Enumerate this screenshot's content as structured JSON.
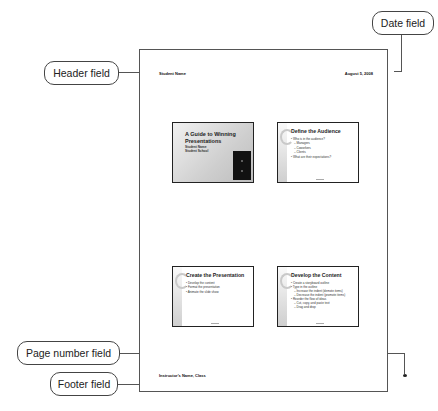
{
  "callouts": {
    "header": "Header field",
    "date": "Date field",
    "page_number": "Page number field",
    "footer": "Footer field"
  },
  "page": {
    "header_text": "Student Name",
    "date_text": "August 5, 2008",
    "footer_text": "Instructor's Name, Class"
  },
  "slides": [
    {
      "type": "title",
      "title": "A Guide to Winning Presentations",
      "subtitle_lines": [
        "Student Name",
        "Student School"
      ]
    },
    {
      "type": "content",
      "title": "Define the Audience",
      "bullets": [
        {
          "text": "• Who is in the audience?",
          "level": 1
        },
        {
          "text": "– Managers",
          "level": 2
        },
        {
          "text": "– Coworkers",
          "level": 2
        },
        {
          "text": "– Clients",
          "level": 2
        },
        {
          "text": "• What are their expectations?",
          "level": 1
        }
      ]
    },
    {
      "type": "content",
      "title": "Create the Presentation",
      "bullets": [
        {
          "text": "• Develop the content",
          "level": 1
        },
        {
          "text": "• Format the presentation",
          "level": 1
        },
        {
          "text": "• Animate the slide show",
          "level": 1
        }
      ]
    },
    {
      "type": "content",
      "title": "Develop the Content",
      "bullets": [
        {
          "text": "• Create a storyboard outline",
          "level": 1
        },
        {
          "text": "• Type in the outline",
          "level": 1
        },
        {
          "text": "– Increase the indent (demote items)",
          "level": 2
        },
        {
          "text": "– Decrease the indent (promote items)",
          "level": 2
        },
        {
          "text": "• Reorder the flow of ideas",
          "level": 1
        },
        {
          "text": "– Cut, copy, and paste text",
          "level": 2
        },
        {
          "text": "– Drag and drop",
          "level": 2
        }
      ]
    }
  ]
}
